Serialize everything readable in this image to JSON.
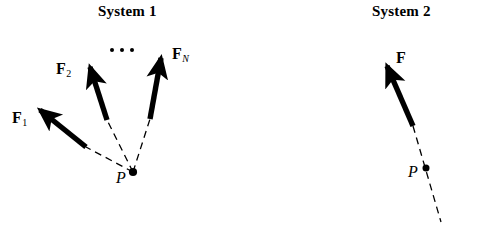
{
  "figure": {
    "background_color": "#ffffff",
    "stroke_color": "#000000",
    "width": 479,
    "height": 233
  },
  "systems": [
    {
      "title": "System 1",
      "point_label": "P",
      "vectors": [
        {
          "name": "F1",
          "base": "F",
          "subscript": "1",
          "subscript_italic": false
        },
        {
          "name": "F2",
          "base": "F",
          "subscript": "2",
          "subscript_italic": false
        },
        {
          "name": "FN",
          "base": "F",
          "subscript": "N",
          "subscript_italic": true
        }
      ],
      "ellipsis": "• • •"
    },
    {
      "title": "System 2",
      "point_label": "P",
      "vectors": [
        {
          "name": "F",
          "base": "F",
          "subscript": "",
          "subscript_italic": false
        }
      ]
    }
  ],
  "labels": {
    "system1_title": "System 1",
    "system2_title": "System 2",
    "f1_base": "F",
    "f1_sub": "1",
    "f2_base": "F",
    "f2_sub": "2",
    "fn_base": "F",
    "fn_sub": "N",
    "f_base": "F",
    "p1": "P",
    "p2": "P"
  }
}
